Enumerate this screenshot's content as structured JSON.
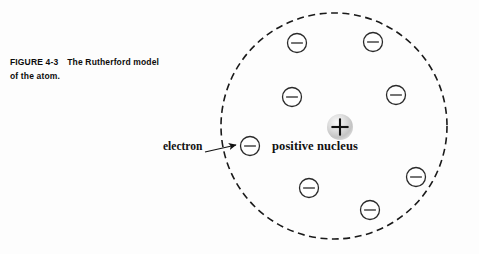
{
  "figure": {
    "caption_label": "FIGURE 4-3",
    "caption_text": "The Rutherford model of the atom.",
    "caption_line1": "The Rutherford model",
    "caption_line2": "of the atom."
  },
  "diagram": {
    "title": "Rutherford model of the atom",
    "background_color": "#fdfdfd",
    "boundary": {
      "name": "atom-boundary",
      "style": "dashed-circle",
      "stroke_color": "#1a1a1a",
      "fill": "none",
      "cx": 334,
      "cy": 126,
      "r": 113,
      "stroke_width": 1.6,
      "dash": "7,4.5"
    },
    "nucleus": {
      "label": "positive nucleus",
      "charge_symbol": "+",
      "cx": 340,
      "cy": 127,
      "r": 13,
      "fill_color": "#c9c9c9",
      "highlight_color": "#f2f2f2",
      "symbol_color": "#111111"
    },
    "electron_label": {
      "label": "electron",
      "x": 163,
      "y": 140
    },
    "pointer": {
      "name": "electron-pointer-arrow",
      "from_x": 205,
      "from_y": 152,
      "to_x": 236,
      "to_y": 145,
      "stroke_color": "#111111"
    },
    "electron_symbol": {
      "charge_symbol": "−",
      "r": 9.5,
      "stroke_color": "#2a2a2a",
      "fill": "#ffffff",
      "stroke_width": 1.3
    },
    "electrons": [
      {
        "id": "electron-1",
        "cx": 297,
        "cy": 43
      },
      {
        "id": "electron-2",
        "cx": 373,
        "cy": 42
      },
      {
        "id": "electron-3",
        "cx": 292,
        "cy": 97
      },
      {
        "id": "electron-4",
        "cx": 396,
        "cy": 95
      },
      {
        "id": "electron-5",
        "cx": 250,
        "cy": 146
      },
      {
        "id": "electron-6",
        "cx": 309,
        "cy": 188
      },
      {
        "id": "electron-7",
        "cx": 370,
        "cy": 210
      },
      {
        "id": "electron-8",
        "cx": 416,
        "cy": 177
      }
    ],
    "electron_count": 8
  }
}
